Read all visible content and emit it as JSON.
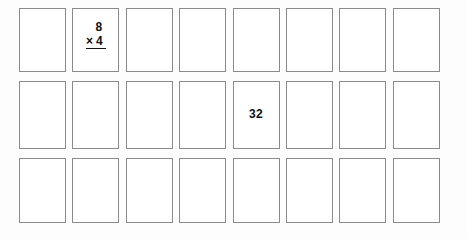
{
  "worksheet": {
    "title": "Multiplication flashcard grid",
    "columns": 8,
    "rows": 3,
    "total_cards": 24,
    "card_border_color": "#8a8a8a",
    "card_fill_color": "#ffffff",
    "text_color": "#111111",
    "background_color": "#fdfdfd"
  },
  "cards": [
    {
      "id": "r1c1",
      "row": 1,
      "column": 1,
      "type": "blank",
      "content": ""
    },
    {
      "id": "r1c2",
      "row": 1,
      "column": 2,
      "type": "problem",
      "factor_top": "8",
      "operator": "×",
      "factor_bottom": "4",
      "content": "8 × 4"
    },
    {
      "id": "r1c3",
      "row": 1,
      "column": 3,
      "type": "blank",
      "content": ""
    },
    {
      "id": "r1c4",
      "row": 1,
      "column": 4,
      "type": "blank",
      "content": ""
    },
    {
      "id": "r1c5",
      "row": 1,
      "column": 5,
      "type": "blank",
      "content": ""
    },
    {
      "id": "r1c6",
      "row": 1,
      "column": 6,
      "type": "blank",
      "content": ""
    },
    {
      "id": "r1c7",
      "row": 1,
      "column": 7,
      "type": "blank",
      "content": ""
    },
    {
      "id": "r1c8",
      "row": 1,
      "column": 8,
      "type": "blank",
      "content": ""
    },
    {
      "id": "r2c1",
      "row": 2,
      "column": 1,
      "type": "blank",
      "content": ""
    },
    {
      "id": "r2c2",
      "row": 2,
      "column": 2,
      "type": "blank",
      "content": ""
    },
    {
      "id": "r2c3",
      "row": 2,
      "column": 3,
      "type": "blank",
      "content": ""
    },
    {
      "id": "r2c4",
      "row": 2,
      "column": 4,
      "type": "blank",
      "content": ""
    },
    {
      "id": "r2c5",
      "row": 2,
      "column": 5,
      "type": "answer",
      "content": "32"
    },
    {
      "id": "r2c6",
      "row": 2,
      "column": 6,
      "type": "blank",
      "content": ""
    },
    {
      "id": "r2c7",
      "row": 2,
      "column": 7,
      "type": "blank",
      "content": ""
    },
    {
      "id": "r2c8",
      "row": 2,
      "column": 8,
      "type": "blank",
      "content": ""
    },
    {
      "id": "r3c1",
      "row": 3,
      "column": 1,
      "type": "blank",
      "content": ""
    },
    {
      "id": "r3c2",
      "row": 3,
      "column": 2,
      "type": "blank",
      "content": ""
    },
    {
      "id": "r3c3",
      "row": 3,
      "column": 3,
      "type": "blank",
      "content": ""
    },
    {
      "id": "r3c4",
      "row": 3,
      "column": 4,
      "type": "blank",
      "content": ""
    },
    {
      "id": "r3c5",
      "row": 3,
      "column": 5,
      "type": "blank",
      "content": ""
    },
    {
      "id": "r3c6",
      "row": 3,
      "column": 6,
      "type": "blank",
      "content": ""
    },
    {
      "id": "r3c7",
      "row": 3,
      "column": 7,
      "type": "blank",
      "content": ""
    },
    {
      "id": "r3c8",
      "row": 3,
      "column": 8,
      "type": "blank",
      "content": ""
    }
  ]
}
